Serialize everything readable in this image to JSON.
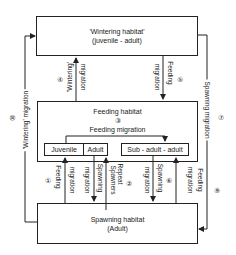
{
  "wintering_box": {
    "line1": "'Wintering habitat'",
    "line2": "(juvenile - adult)"
  },
  "feeding_box": {
    "title": "Feeding habitat",
    "num": "③",
    "subtitle": "Feeding migration"
  },
  "inner": {
    "juvenile": "Juvenile",
    "adult": "Adult",
    "sub_adult": "Sub - adult - adult"
  },
  "spawning_box": {
    "line1": "Spawning habitat",
    "line2": "(Adult)"
  },
  "arrows": {
    "a4": {
      "num": "④",
      "label1": "'Wintering'",
      "label2": "migration"
    },
    "a5": {
      "num": "⑤",
      "label1": "Feeding",
      "label2": "migration"
    },
    "a1": {
      "num": "①",
      "label1": "Feeding",
      "label2": "migration"
    },
    "a_spawn_left": {
      "label1": "Spawning",
      "label2": "migration"
    },
    "a2": {
      "num": "②",
      "label1": "Repeat",
      "label2": "Spawners"
    },
    "a6": {
      "num": "⑥",
      "label1": "Spawning",
      "label2": "migration"
    },
    "a_feed_right": {
      "label1": "Feeding",
      "label2": "migration"
    },
    "left_loop": {
      "num": "⑩",
      "label": "'Wintering' migration"
    },
    "right_loop": {
      "num7": "⑦",
      "num9": "⑨",
      "label": "Spawning migration"
    }
  }
}
